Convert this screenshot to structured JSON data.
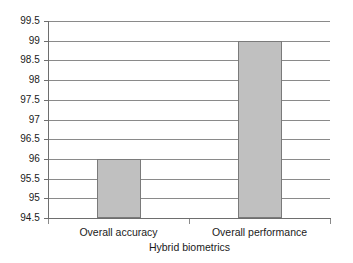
{
  "chart_data": {
    "type": "bar",
    "title": "",
    "xlabel": "Hybrid biometrics",
    "ylabel": "",
    "categories": [
      "Overall accuracy",
      "Overall performance"
    ],
    "values": [
      96,
      99
    ],
    "ylim": [
      94.5,
      99.5
    ],
    "ytick_step": 0.5,
    "yticks": [
      99.5,
      99,
      98.5,
      98,
      97.5,
      97,
      96.5,
      96,
      95.5,
      95,
      94.5
    ],
    "ytick_labels": [
      "99.5",
      "99",
      "98.5",
      "98",
      "97.5",
      "97",
      "96.5",
      "96",
      "95.5",
      "95",
      "94.5"
    ],
    "grid": true,
    "legend": false,
    "legend_position": "none",
    "series": [
      {
        "name": "Hybrid biometrics",
        "values": [
          96,
          99
        ]
      }
    ],
    "bar_fill_color": "#c0c0c0",
    "bar_border_color": "#7a7a7a",
    "gridline_color": "#8a8a8a",
    "axis_color": "#6e6e6e",
    "background_color": "#ffffff"
  }
}
